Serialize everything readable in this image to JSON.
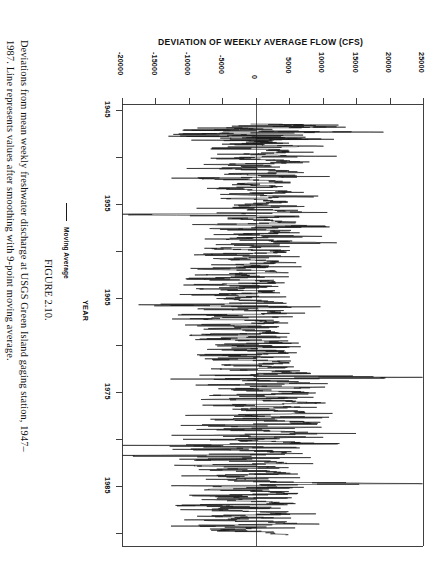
{
  "figure": {
    "number_label": "FIGURE 2.10.",
    "caption_line_1": "Deviations from mean weekly freshwater discharge at USGS Green Island gaging station, 1947–",
    "caption_line_2": "1987. Line represents values after smoothing with 9-point moving average."
  },
  "legend": {
    "entries": [
      {
        "label": "Moving Average",
        "color": "#1a1a1a",
        "marker": "line-swatch"
      }
    ]
  },
  "chart_data": {
    "type": "line",
    "title": "DEVIATION OF WEEKLY AVERAGE FLOW (CFS)",
    "xlabel": "YEAR",
    "ylabel": "DEVIATION OF WEEKLY AVERAGE FLOW (CFS)",
    "orientation": "rotated-90-clockwise",
    "grid": false,
    "legend_position": "left-outside",
    "value_axis": {
      "label": "DEVIATION OF WEEKLY AVERAGE FLOW (CFS)",
      "ticks": [
        -20000,
        -15000,
        -10000,
        -5000,
        0,
        5000,
        10000,
        15000,
        20000,
        25000
      ],
      "tick_labels": [
        "-20000",
        "-15000",
        "-10000",
        "-5000",
        "0",
        "5000",
        "10000",
        "15000",
        "20000",
        "25000"
      ],
      "range": [
        -20000,
        25000
      ],
      "zero_line": true
    },
    "time_axis": {
      "label": "YEAR",
      "major_ticks": [
        1945,
        1955,
        1965,
        1975,
        1985
      ],
      "major_tick_labels": [
        "1945",
        "1955",
        "1965",
        "1975",
        "1985"
      ],
      "minor_ticks": [
        1950,
        1960,
        1970,
        1980
      ],
      "range": [
        1945,
        1989
      ]
    },
    "series": [
      {
        "name": "Moving Average",
        "color": "#1a1a1a",
        "x_units": "year",
        "y_units": "CFS",
        "note": "Weekly deviations 1947-1987, 9-point moving average smoothing",
        "x": [
          1947.0,
          1947.1,
          1947.2,
          1947.3,
          1947.4,
          1947.5,
          1947.6,
          1947.7,
          1947.8,
          1947.9,
          1948.0,
          1948.1,
          1948.2,
          1948.3,
          1948.4,
          1948.5,
          1948.6,
          1948.7,
          1948.8,
          1948.9,
          1949.0,
          1949.2,
          1949.4,
          1949.6,
          1949.8,
          1950.0,
          1950.2,
          1950.4,
          1950.6,
          1950.8,
          1951.0,
          1951.2,
          1951.4,
          1951.6,
          1951.8,
          1952.0,
          1952.2,
          1952.4,
          1952.6,
          1952.8,
          1953.0,
          1953.2,
          1953.4,
          1953.6,
          1953.8,
          1954.0,
          1954.2,
          1954.4,
          1954.6,
          1954.8,
          1955.0,
          1955.2,
          1955.4,
          1955.6,
          1955.8,
          1956.0,
          1956.2,
          1956.4,
          1956.6,
          1956.8,
          1957.0,
          1957.2,
          1957.4,
          1957.6,
          1957.8,
          1958.0,
          1958.2,
          1958.4,
          1958.6,
          1958.8,
          1959.0,
          1959.2,
          1959.4,
          1959.6,
          1959.8,
          1960.0,
          1960.2,
          1960.4,
          1960.6,
          1960.8,
          1961.0,
          1961.2,
          1961.4,
          1961.6,
          1961.8,
          1962.0,
          1962.2,
          1962.4,
          1962.6,
          1962.8,
          1963.0,
          1963.2,
          1963.4,
          1963.6,
          1963.8,
          1964.0,
          1964.2,
          1964.4,
          1964.6,
          1964.8,
          1965.0,
          1965.2,
          1965.4,
          1965.6,
          1965.8,
          1966.0,
          1966.2,
          1966.4,
          1966.6,
          1966.8,
          1967.0,
          1967.2,
          1967.4,
          1967.6,
          1967.8,
          1968.0,
          1968.2,
          1968.4,
          1968.6,
          1968.8,
          1969.0,
          1969.2,
          1969.4,
          1969.6,
          1969.8,
          1970.0,
          1970.2,
          1970.4,
          1970.6,
          1970.8,
          1971.0,
          1971.2,
          1971.4,
          1971.6,
          1971.8,
          1972.0,
          1972.2,
          1972.4,
          1972.6,
          1972.8,
          1973.0,
          1973.2,
          1973.4,
          1973.6,
          1973.8,
          1974.0,
          1974.2,
          1974.4,
          1974.6,
          1974.8,
          1975.0,
          1975.2,
          1975.4,
          1975.6,
          1975.8,
          1976.0,
          1976.2,
          1976.4,
          1976.6,
          1976.8,
          1977.0,
          1977.2,
          1977.4,
          1977.6,
          1977.8,
          1978.0,
          1978.2,
          1978.4,
          1978.6,
          1978.8,
          1979.0,
          1979.2,
          1979.4,
          1979.6,
          1979.8,
          1980.0,
          1980.2,
          1980.4,
          1980.6,
          1980.8,
          1981.0,
          1981.2,
          1981.4,
          1981.6,
          1981.8,
          1982.0,
          1982.2,
          1982.4,
          1982.6,
          1982.8,
          1983.0,
          1983.2,
          1983.4,
          1983.6,
          1983.8,
          1984.0,
          1984.2,
          1984.4,
          1984.6,
          1984.8,
          1985.0,
          1985.2,
          1985.4,
          1985.6,
          1985.8,
          1986.0,
          1986.2,
          1986.4,
          1986.6,
          1986.8,
          1987.0,
          1987.2,
          1987.4,
          1987.6,
          1987.9
        ],
        "y": [
          1200,
          9000,
          -2000,
          12000,
          -4000,
          2000,
          -8000,
          1000,
          14000,
          -3000,
          -11000,
          3000,
          -9000,
          5000,
          -2000,
          9000,
          -6000,
          2000,
          -1000,
          4000,
          -3500,
          6000,
          -7000,
          3000,
          5000,
          -2000,
          7000,
          -4000,
          2500,
          6500,
          -5000,
          4000,
          -6500,
          3000,
          5500,
          -2500,
          6000,
          -8000,
          2000,
          4500,
          -3000,
          3500,
          -5500,
          1500,
          5000,
          -4000,
          7500,
          -3000,
          2000,
          4000,
          -2000,
          5500,
          -6000,
          3500,
          6000,
          -15500,
          4500,
          -3000,
          2500,
          5000,
          -4500,
          9000,
          -7000,
          3000,
          4000,
          -2500,
          6500,
          -5000,
          2000,
          9500,
          -3500,
          4000,
          -6000,
          2500,
          3500,
          -7000,
          5000,
          -4000,
          1500,
          4500,
          -5500,
          3000,
          -8000,
          2000,
          3000,
          -6000,
          2500,
          -9000,
          1000,
          2000,
          -7500,
          1500,
          -6500,
          500,
          2500,
          -8500,
          2000,
          -5000,
          1000,
          3000,
          -16000,
          3500,
          -7000,
          2000,
          4000,
          -9000,
          2500,
          -8000,
          1500,
          3500,
          -10000,
          2000,
          -6000,
          1000,
          3000,
          -8000,
          3000,
          -7500,
          2000,
          4000,
          -6500,
          4500,
          -5500,
          2500,
          5000,
          -7000,
          3500,
          -6000,
          3000,
          4500,
          -5000,
          5000,
          -4500,
          3500,
          6000,
          -4000,
          20500,
          -5000,
          4000,
          7000,
          -6000,
          6500,
          -4000,
          5000,
          8000,
          -3500,
          7500,
          -5500,
          4500,
          9000,
          -4500,
          5500,
          -3000,
          6000,
          7500,
          -5000,
          8500,
          -4500,
          5500,
          10500,
          -6500,
          7000,
          -5000,
          4000,
          8000,
          -7000,
          6000,
          -6000,
          3500,
          7000,
          -13500,
          5000,
          -7500,
          3000,
          6000,
          -15000,
          4000,
          -8000,
          2500,
          5000,
          -9000,
          3500,
          -6500,
          2000,
          4500,
          -7500,
          3000,
          -5500,
          2500,
          19500,
          -8000,
          4000,
          -6000,
          3000,
          5500,
          -9500,
          3000,
          -7000,
          2000,
          4500,
          -11000,
          2500,
          -8500,
          1500,
          4000,
          -8000,
          3500,
          -6500,
          2500,
          5000,
          -9000,
          3000,
          -7000,
          2000,
          4500
        ]
      }
    ]
  }
}
